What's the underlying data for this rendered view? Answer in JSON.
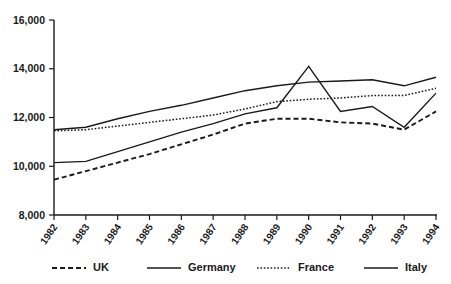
{
  "chart_data": {
    "type": "line",
    "title": "",
    "subtitle": "",
    "xlabel": "",
    "ylabel": "",
    "grid": false,
    "legend_position": "bottom",
    "x": [
      1982,
      1983,
      1984,
      1985,
      1986,
      1987,
      1988,
      1989,
      1990,
      1991,
      1992,
      1993,
      1994
    ],
    "categories": [
      "1982",
      "1983",
      "1984",
      "1985",
      "1986",
      "1987",
      "1988",
      "1989",
      "1990",
      "1991",
      "1992",
      "1993",
      "1994"
    ],
    "ylim": [
      8000,
      16000
    ],
    "xlim": [
      1982,
      1994
    ],
    "ytick_labels": [
      "16,000",
      "14,000",
      "12,000",
      "10,000",
      "8,000"
    ],
    "ytick_values": [
      16000,
      14000,
      12000,
      10000,
      8000
    ],
    "series": [
      {
        "name": "UK",
        "style": "dashed",
        "values": [
          9450,
          9800,
          10150,
          10500,
          10900,
          11300,
          11750,
          11950,
          11950,
          11800,
          11750,
          11500,
          12250
        ]
      },
      {
        "name": "Germany",
        "style": "solid",
        "values": [
          11500,
          11600,
          11950,
          12250,
          12500,
          12800,
          13100,
          13300,
          13450,
          13500,
          13550,
          13300,
          13650
        ]
      },
      {
        "name": "France",
        "style": "dotted",
        "values": [
          11450,
          11500,
          11650,
          11800,
          11950,
          12100,
          12350,
          12650,
          12750,
          12800,
          12900,
          12900,
          13200
        ]
      },
      {
        "name": "Italy",
        "style": "solid",
        "values": [
          10150,
          10200,
          10600,
          11000,
          11400,
          11750,
          12150,
          12400,
          14100,
          12250,
          12450,
          11600,
          13000
        ]
      }
    ]
  },
  "legend": {
    "items": [
      {
        "label": "UK",
        "style": "dashed"
      },
      {
        "label": "Germany",
        "style": "solid"
      },
      {
        "label": "France",
        "style": "dotted"
      },
      {
        "label": "Italy",
        "style": "solid"
      }
    ]
  },
  "colors": {
    "ink": "#1a1a1a",
    "background": "#ffffff"
  }
}
